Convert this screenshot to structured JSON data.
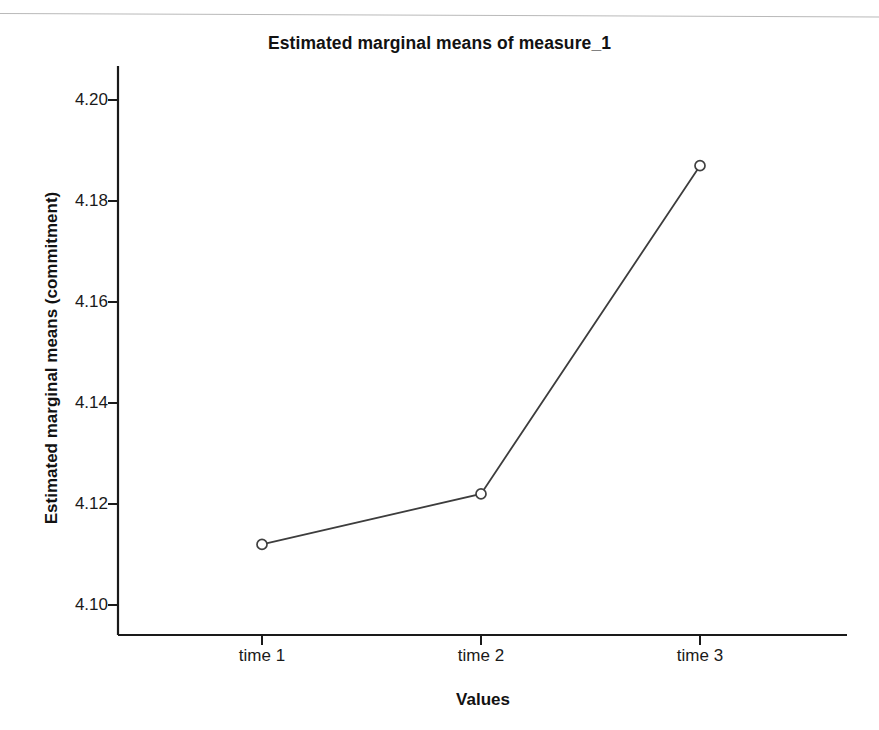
{
  "chart_data": {
    "type": "line",
    "title": "Estimated marginal means of measure_1",
    "xlabel": "Values",
    "ylabel": "Estimated marginal means (commitment)",
    "categories": [
      "time 1",
      "time 2",
      "time 3"
    ],
    "values": [
      4.112,
      4.122,
      4.187
    ],
    "series": [
      {
        "name": "measure_1",
        "values": [
          4.112,
          4.122,
          4.187
        ]
      }
    ],
    "yticks": [
      "4.10",
      "4.12",
      "4.14",
      "4.16",
      "4.18",
      "4.20"
    ],
    "ytick_values": [
      4.1,
      4.12,
      4.14,
      4.16,
      4.18,
      4.2
    ],
    "ylim": [
      4.095,
      4.205
    ],
    "xtick_labels": [
      "time 1",
      "time 2",
      "time 3"
    ],
    "grid": false,
    "legend": "none",
    "marker": "open-circle",
    "line_color": "#404040",
    "marker_color": "#404040",
    "axis_color": "#1a1a1a",
    "background_color": "#ffffff"
  },
  "axes": {
    "y_tick_0": "4.10",
    "y_tick_1": "4.12",
    "y_tick_2": "4.14",
    "y_tick_3": "4.16",
    "y_tick_4": "4.18",
    "y_tick_5": "4.20",
    "x_tick_0": "time 1",
    "x_tick_1": "time 2",
    "x_tick_2": "time 3"
  }
}
